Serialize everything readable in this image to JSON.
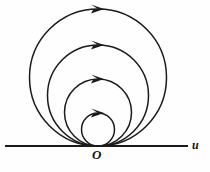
{
  "figure": {
    "type": "diagram",
    "background_color": "#fefefe",
    "stroke_color": "#1a1a1a"
  },
  "axis": {
    "name": "horizontal-axis",
    "label": "u",
    "label_style": "italic",
    "x_start": 5,
    "x_end": 188,
    "y": 146,
    "stroke_width": 2.1
  },
  "origin": {
    "name": "origin-point",
    "label": "O",
    "label_style": "italic-bold",
    "x": 98,
    "y": 146
  },
  "orbits": [
    {
      "name": "orbit-1-innermost",
      "index": 1,
      "center_x": 98,
      "center_y": 129.5,
      "radius": 16.5,
      "top_y": 113,
      "left_x": 81.5,
      "right_x": 114.5,
      "direction": "clockwise",
      "arrow_angle_deg": -90,
      "stroke_width": 1.5
    },
    {
      "name": "orbit-2",
      "index": 2,
      "center_x": 98,
      "center_y": 112.5,
      "radius": 33.5,
      "top_y": 79,
      "left_x": 64.5,
      "right_x": 131.5,
      "direction": "clockwise",
      "arrow_angle_deg": -90,
      "stroke_width": 1.5
    },
    {
      "name": "orbit-3",
      "index": 3,
      "center_x": 98,
      "center_y": 95.5,
      "radius": 50.5,
      "top_y": 45,
      "left_x": 47.5,
      "right_x": 148.5,
      "direction": "clockwise",
      "arrow_angle_deg": -90,
      "stroke_width": 1.5
    },
    {
      "name": "orbit-4-outermost",
      "index": 4,
      "center_x": 98,
      "center_y": 77.5,
      "radius": 68.5,
      "top_y": 9,
      "left_x": 29.5,
      "right_x": 166.5,
      "direction": "clockwise",
      "arrow_angle_deg": -90,
      "stroke_width": 1.5
    }
  ],
  "arrowheads": [
    {
      "name": "arrowhead-orbit-1",
      "x": 98,
      "y": 113,
      "points_to": "right"
    },
    {
      "name": "arrowhead-orbit-2",
      "x": 98,
      "y": 79,
      "points_to": "right"
    },
    {
      "name": "arrowhead-orbit-3",
      "x": 98,
      "y": 45,
      "points_to": "right"
    },
    {
      "name": "arrowhead-orbit-4",
      "x": 98,
      "y": 9,
      "points_to": "right"
    }
  ]
}
